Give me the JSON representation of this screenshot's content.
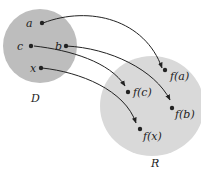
{
  "diagram": {
    "colors": {
      "domain_fill": "#bdbdbd",
      "range_fill": "#d9d9d9",
      "stroke": "#222222",
      "background": "#ffffff"
    },
    "domain_set": {
      "label": "D"
    },
    "range_set": {
      "label": "R"
    },
    "domain_points": [
      {
        "label": "a"
      },
      {
        "label": "c"
      },
      {
        "label": "b"
      },
      {
        "label": "x"
      }
    ],
    "range_points": [
      {
        "label": "f(a)"
      },
      {
        "label": "f(c)"
      },
      {
        "label": "f(b)"
      },
      {
        "label": "f(x)"
      }
    ],
    "mappings": [
      {
        "from": "a",
        "to": "f(a)"
      },
      {
        "from": "b",
        "to": "f(b)"
      },
      {
        "from": "c",
        "to": "f(c)"
      },
      {
        "from": "x",
        "to": "f(x)"
      }
    ]
  }
}
